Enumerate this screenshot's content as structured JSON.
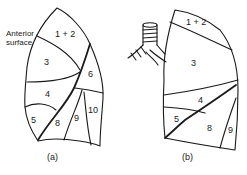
{
  "diagram": {
    "type": "anatomical-line-drawing",
    "panels": [
      {
        "caption": "(a)",
        "annotation": [
          "Anterior",
          "surface"
        ],
        "segments": [
          "1 + 2",
          "3",
          "6",
          "4",
          "5",
          "8",
          "9",
          "10"
        ]
      },
      {
        "caption": "(b)",
        "segments": [
          "1 + 2",
          "3",
          "4",
          "5",
          "8",
          "9"
        ]
      }
    ]
  },
  "colors": {
    "line": "#1a1a1a",
    "background": "#ffffff"
  }
}
